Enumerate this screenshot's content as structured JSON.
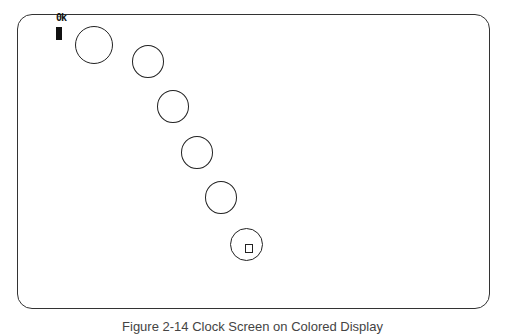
{
  "screen": {
    "status_text": "0k",
    "cursor": "block-cursor",
    "border_color": "#333333",
    "background": "#ffffff"
  },
  "circles": [
    {
      "cx": 94,
      "cy": 45,
      "d": 38,
      "has_marker": false
    },
    {
      "cx": 148,
      "cy": 61,
      "d": 32,
      "has_marker": false
    },
    {
      "cx": 173,
      "cy": 107,
      "d": 32,
      "has_marker": false
    },
    {
      "cx": 197,
      "cy": 153,
      "d": 32,
      "has_marker": false
    },
    {
      "cx": 221,
      "cy": 198,
      "d": 32,
      "has_marker": false
    },
    {
      "cx": 246,
      "cy": 245,
      "d": 33,
      "has_marker": true
    }
  ],
  "caption": {
    "text": "Figure 2-14  Clock Screen on Colored Display"
  }
}
